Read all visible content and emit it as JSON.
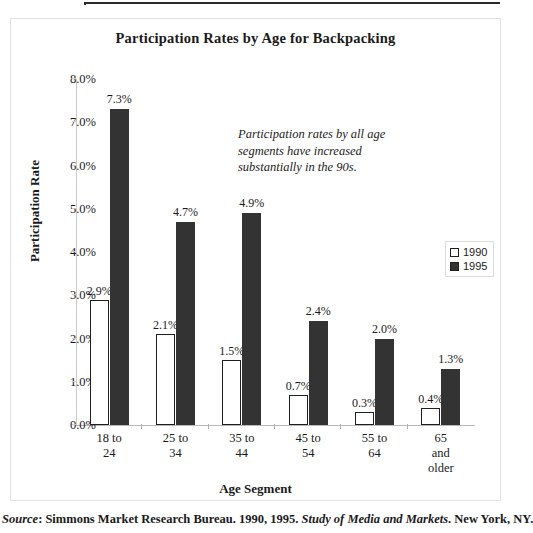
{
  "chart_data": {
    "type": "bar",
    "title": "Participation Rates by Age for Backpacking",
    "xlabel": "Age Segment",
    "ylabel": "Participation Rate",
    "categories": [
      "18 to 24",
      "25 to 34",
      "35 to 44",
      "45 to 54",
      "55 to 64",
      "65 and older"
    ],
    "category_lines": [
      [
        "18 to",
        "24"
      ],
      [
        "25 to",
        "34"
      ],
      [
        "35 to",
        "44"
      ],
      [
        "45 to",
        "54"
      ],
      [
        "55 to",
        "64"
      ],
      [
        "65",
        "and",
        "older"
      ]
    ],
    "series": [
      {
        "name": "1990",
        "color": "#ffffff",
        "border_color": "#1f1f1f",
        "values": [
          2.9,
          2.1,
          1.5,
          0.7,
          0.3,
          0.4
        ],
        "labels": [
          "2.9%",
          "2.1%",
          "1.5%",
          "0.7%",
          "0.3%",
          "0.4%"
        ]
      },
      {
        "name": "1995",
        "color": "#333333",
        "border_color": "#1f1f1f",
        "values": [
          7.3,
          4.7,
          4.9,
          2.4,
          2.0,
          1.3
        ],
        "labels": [
          "7.3%",
          "4.7%",
          "4.9%",
          "2.4%",
          "2.0%",
          "1.3%"
        ]
      }
    ],
    "ylim": [
      0,
      8
    ],
    "ytick_values": [
      8.0,
      7.0,
      6.0,
      5.0,
      4.0,
      3.0,
      2.0,
      1.0,
      0.0
    ],
    "ytick_labels": [
      "8.0%",
      "7.0%",
      "6.0%",
      "5.0%",
      "4.0%",
      "3.0%",
      "2.0%",
      "1.0%",
      "0.0%"
    ],
    "grid": false,
    "legend_position": "right-middle",
    "legend_entries": [
      "1990",
      "1995"
    ],
    "annotation": "Participation rates by all age segments have increased substantially in the 90s."
  },
  "source": {
    "label": "Source",
    "separator": ": ",
    "publisher": "Simmons Market Research Bureau. 1990, 1995. ",
    "publication": "Study of Media and Markets",
    "location": ". New York, NY."
  }
}
